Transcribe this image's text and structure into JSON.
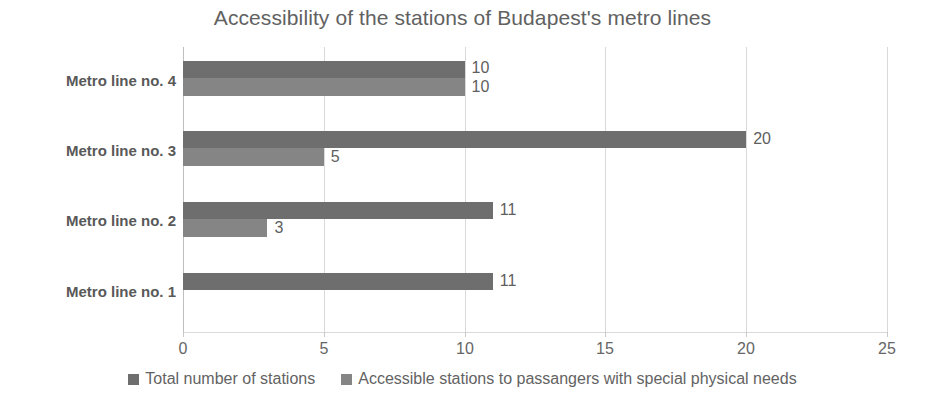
{
  "chart_data": {
    "type": "bar",
    "orientation": "horizontal",
    "title": "Accessibility of the stations of Budapest's metro lines",
    "xlabel": "",
    "ylabel": "",
    "categories": [
      "Metro line no. 1",
      "Metro line no. 2",
      "Metro line no. 3",
      "Metro line no.  4"
    ],
    "series": [
      {
        "name": "Total number of stations",
        "color": "#6e6e6e",
        "values": [
          11,
          11,
          20,
          10
        ],
        "labels": [
          "11",
          "11",
          "20",
          "10"
        ]
      },
      {
        "name": "Accessible stations  to passangers with special physical needs",
        "color": "#858585",
        "values": [
          0,
          3,
          5,
          10
        ],
        "labels": [
          "",
          "3",
          "5",
          "10"
        ]
      }
    ],
    "xlim": [
      0,
      25
    ],
    "xticks": [
      0,
      5,
      10,
      15,
      20,
      25
    ],
    "xtick_labels": [
      "0",
      "5",
      "10",
      "15",
      "20",
      "25"
    ],
    "grid": true,
    "grid_color": "#d9d9d9",
    "legend_position": "bottom",
    "background": "#ffffff",
    "text_color": "#5e5e5e"
  }
}
